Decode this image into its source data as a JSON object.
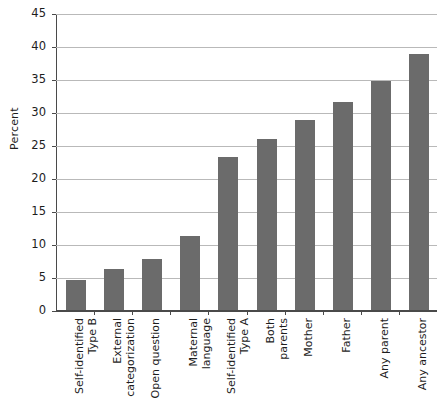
{
  "chart_data": {
    "type": "bar",
    "title": "",
    "xlabel": "",
    "ylabel": "Percent",
    "ylim": [
      0,
      45
    ],
    "yticks": [
      0,
      5,
      10,
      15,
      20,
      25,
      30,
      35,
      40,
      45
    ],
    "grid": true,
    "legend": false,
    "bar_color": "#6b6b6b",
    "categories": [
      "Self-identified\nType B",
      "External\ncategorization",
      "Open question",
      "Maternal\nlanguage",
      "Self-identified\nType A",
      "Both\nparents",
      "Mother",
      "Father",
      "Any parent",
      "Any ancestor"
    ],
    "values": [
      4.7,
      6.3,
      7.9,
      11.3,
      23.3,
      26.0,
      29.0,
      31.7,
      34.8,
      39.0
    ]
  },
  "axes": {
    "y_title": "Percent"
  }
}
